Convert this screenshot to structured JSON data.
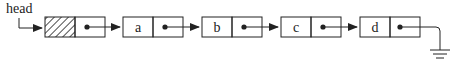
{
  "diagram": {
    "head_label": "head",
    "nodes": [
      {
        "value": "",
        "kind": "header"
      },
      {
        "value": "a"
      },
      {
        "value": "b"
      },
      {
        "value": "c"
      },
      {
        "value": "d"
      }
    ],
    "terminator": "null-ground",
    "colors": {
      "stroke": "#222222",
      "background": "#ffffff"
    }
  }
}
